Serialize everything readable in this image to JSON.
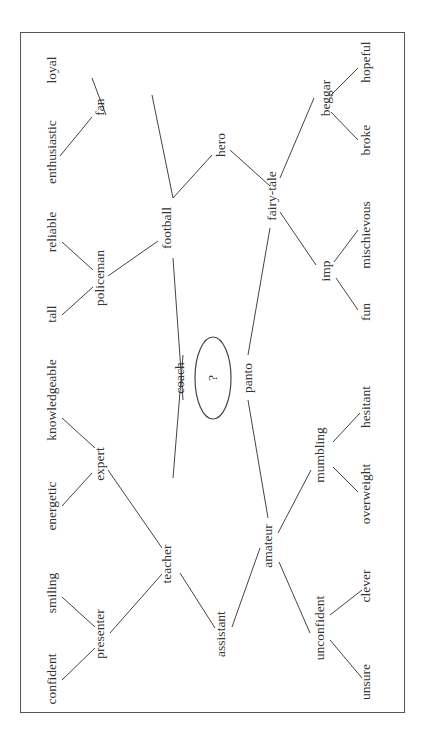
{
  "diagram": {
    "center": {
      "label": "?",
      "x": 213,
      "y": 378
    },
    "nodes": [
      {
        "id": "coach",
        "label": "coach",
        "x": 180,
        "y": 378
      },
      {
        "id": "panto",
        "label": "panto",
        "x": 248,
        "y": 378
      },
      {
        "id": "football",
        "label": "football",
        "x": 167,
        "y": 228
      },
      {
        "id": "fairy-tale",
        "label": "fairy-tale",
        "x": 272,
        "y": 196
      },
      {
        "id": "hero",
        "label": "hero",
        "x": 221,
        "y": 145
      },
      {
        "id": "fan",
        "label": "fan",
        "x": 100,
        "y": 107
      },
      {
        "id": "loyal",
        "label": "loyal",
        "x": 52,
        "y": 70
      },
      {
        "id": "enthusiastic",
        "label": "enthusiastic",
        "x": 52,
        "y": 152
      },
      {
        "id": "policeman",
        "label": "policeman",
        "x": 100,
        "y": 278
      },
      {
        "id": "reliable",
        "label": "reliable",
        "x": 52,
        "y": 232
      },
      {
        "id": "tall",
        "label": "tall",
        "x": 52,
        "y": 314
      },
      {
        "id": "beggar",
        "label": "beggar",
        "x": 326,
        "y": 98
      },
      {
        "id": "hopeful",
        "label": "hopeful",
        "x": 366,
        "y": 62
      },
      {
        "id": "broke",
        "label": "broke",
        "x": 366,
        "y": 140
      },
      {
        "id": "imp",
        "label": "imp",
        "x": 326,
        "y": 271
      },
      {
        "id": "mischievous",
        "label": "mischievous",
        "x": 366,
        "y": 235
      },
      {
        "id": "fun",
        "label": "fun",
        "x": 366,
        "y": 312
      },
      {
        "id": "teacher",
        "label": "teacher",
        "x": 167,
        "y": 564
      },
      {
        "id": "amateur",
        "label": "amateur",
        "x": 268,
        "y": 546
      },
      {
        "id": "assistant",
        "label": "assistant",
        "x": 221,
        "y": 634
      },
      {
        "id": "expert",
        "label": "expert",
        "x": 100,
        "y": 464
      },
      {
        "id": "knowledgeable",
        "label": "knowledgeable",
        "x": 52,
        "y": 400
      },
      {
        "id": "energetic",
        "label": "energetic",
        "x": 52,
        "y": 506
      },
      {
        "id": "presenter",
        "label": "presenter",
        "x": 100,
        "y": 634
      },
      {
        "id": "smiling",
        "label": "smiling",
        "x": 52,
        "y": 593
      },
      {
        "id": "confident",
        "label": "confident",
        "x": 52,
        "y": 679
      },
      {
        "id": "mumbling",
        "label": "mumbling",
        "x": 320,
        "y": 455
      },
      {
        "id": "hesitant",
        "label": "hesitant",
        "x": 366,
        "y": 407
      },
      {
        "id": "overweight",
        "label": "overweight",
        "x": 366,
        "y": 494
      },
      {
        "id": "unconfident",
        "label": "unconfident",
        "x": 320,
        "y": 628
      },
      {
        "id": "clever",
        "label": "clever",
        "x": 366,
        "y": 586
      },
      {
        "id": "unsure",
        "label": "unsure",
        "x": 366,
        "y": 682
      }
    ],
    "edges": [
      [
        183,
        400,
        173,
        258
      ],
      [
        183,
        355,
        173,
        478
      ],
      [
        248,
        355,
        270,
        228
      ],
      [
        248,
        400,
        268,
        518
      ],
      [
        173,
        198,
        152,
        95
      ],
      [
        173,
        198,
        212,
        155
      ],
      [
        230,
        150,
        270,
        186
      ],
      [
        280,
        178,
        314,
        98
      ],
      [
        280,
        212,
        316,
        265
      ],
      [
        106,
        115,
        92,
        78
      ],
      [
        92,
        117,
        60,
        156
      ],
      [
        108,
        276,
        158,
        241
      ],
      [
        93,
        270,
        62,
        242
      ],
      [
        93,
        287,
        62,
        315
      ],
      [
        331,
        95,
        358,
        68
      ],
      [
        331,
        112,
        358,
        140
      ],
      [
        334,
        262,
        358,
        230
      ],
      [
        336,
        278,
        358,
        310
      ],
      [
        162,
        548,
        108,
        470
      ],
      [
        162,
        574,
        110,
        633
      ],
      [
        180,
        573,
        215,
        628
      ],
      [
        232,
        627,
        260,
        548
      ],
      [
        278,
        533,
        311,
        470
      ],
      [
        279,
        562,
        310,
        633
      ],
      [
        92,
        473,
        62,
        506
      ],
      [
        95,
        448,
        62,
        418
      ],
      [
        95,
        627,
        62,
        597
      ],
      [
        95,
        648,
        62,
        680
      ],
      [
        333,
        442,
        360,
        413
      ],
      [
        333,
        467,
        358,
        492
      ],
      [
        330,
        615,
        362,
        590
      ],
      [
        330,
        640,
        362,
        678
      ]
    ]
  }
}
